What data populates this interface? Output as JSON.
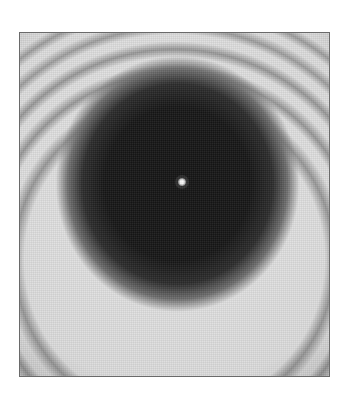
{
  "image": {
    "subject": "diffraction-pattern",
    "colors": {
      "background": "#ffffff",
      "frame_border": "#6a6a6a",
      "disc": "#141414",
      "halo": "#e6e6e6",
      "ring_dark": "#5a5a5a",
      "center_spot": "#ffffff"
    }
  }
}
